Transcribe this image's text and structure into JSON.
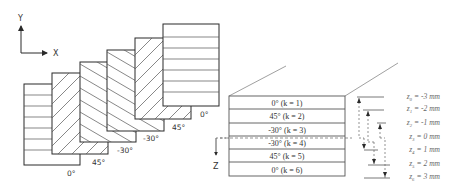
{
  "axes": {
    "y_label": "Y",
    "x_label": "X",
    "z_label": "Z"
  },
  "plies_exploded": [
    {
      "angle": 0,
      "label": "0°"
    },
    {
      "angle": 45,
      "label": "45°"
    },
    {
      "angle": -30,
      "label": "-30°"
    },
    {
      "angle": -30,
      "label": "-30°"
    },
    {
      "angle": 45,
      "label": "45°"
    },
    {
      "angle": 0,
      "label": "0°"
    }
  ],
  "laminate_layers": [
    {
      "label": "0° (k = 1)"
    },
    {
      "label": "45° (k = 2)"
    },
    {
      "label": "-30° (k = 3)"
    },
    {
      "label": "-30°  (k = 4)"
    },
    {
      "label": "45° (k = 5)"
    },
    {
      "label": "0° (k = 6)"
    }
  ],
  "z_coordinates": [
    {
      "label": "z₀ = -3 mm"
    },
    {
      "label": "z₁ = -2 mm"
    },
    {
      "label": "z₂ = -1 mm"
    },
    {
      "label": "z₃ = 0 mm"
    },
    {
      "label": "z₄ = 1 mm"
    },
    {
      "label": "z₅ = 2 mm"
    },
    {
      "label": "z₆ = 3 mm"
    }
  ],
  "colors": {
    "stroke": "#2a2a2a",
    "light_stroke": "#888888",
    "text": "#333333",
    "italic_text": "#666666"
  }
}
